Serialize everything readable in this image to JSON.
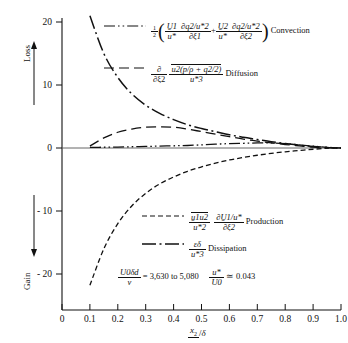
{
  "figure": {
    "y_axis": {
      "upper_label": "Loss",
      "lower_label": "Gain",
      "ticks": [
        "20",
        "10",
        "0",
        "- 10",
        "- 20"
      ],
      "tick_values": [
        20,
        10,
        0,
        -10,
        -20
      ]
    },
    "x_axis": {
      "label_num": "x",
      "label_sub": "2",
      "label_den": "δ",
      "ticks": [
        "0",
        "0.1",
        "0.2",
        "0.3",
        "0.4",
        "0.5",
        "0.6",
        "0.7",
        "0.8",
        "0.9",
        "1.0"
      ],
      "tick_values": [
        0,
        0.1,
        0.2,
        0.3,
        0.4,
        0.5,
        0.6,
        0.7,
        0.8,
        0.9,
        1.0
      ]
    },
    "legend": {
      "convection": {
        "name": "Convection",
        "style": "dash-dot-dot",
        "half": "1",
        "half_den": "2",
        "u1_num": "U̱1",
        "u1_den": "u*",
        "dq1_num": "∂q̱2/u*2",
        "dq1_den": "∂ξ1",
        "plus": "+",
        "u2_num": "U̱2",
        "u2_den": "u*",
        "dq2_num": "∂q̱2/u*2",
        "dq2_den": "∂ξ2"
      },
      "diffusion": {
        "name": "Diffusion",
        "style": "dashed",
        "op_num": "∂",
        "op_den": "∂ξ2",
        "num": "u2(p/ρ + q2/2)",
        "den": "u*3"
      },
      "production": {
        "name": "Production",
        "style": "dashed-short",
        "uu_num": "u̱1u2",
        "uu_den": "u*2",
        "du_num": "∂U̱1/u*",
        "du_den": "∂ξ2"
      },
      "dissipation": {
        "name": "Dissipation",
        "style": "dash-dot",
        "num": "εδ",
        "den": "u*3"
      }
    },
    "annotation": {
      "re_num": "U0δd",
      "re_den": "ν",
      "re_eq": "= 3,630 to 5,080",
      "ratio_num": "u*",
      "ratio_den": "U0",
      "ratio_eq": "≃ 0.043"
    }
  },
  "chart_data": {
    "type": "line",
    "title": "",
    "xlabel": "x2/δ",
    "ylabel": "Loss / Gain",
    "xlim": [
      0.0,
      1.0
    ],
    "ylim": [
      -23,
      22
    ],
    "grid": false,
    "legend_position": "inside-right",
    "zero_line": true,
    "series": [
      {
        "name": "Convection",
        "dash": "dash-dot-dot",
        "x": [
          0.1,
          0.15,
          0.2,
          0.25,
          0.3,
          0.35,
          0.4,
          0.45,
          0.5,
          0.55,
          0.6,
          0.65,
          0.7,
          0.75,
          0.8,
          0.85,
          0.9,
          0.95,
          1.0
        ],
        "y": [
          0.1,
          0.12,
          0.15,
          0.2,
          0.25,
          0.3,
          0.35,
          0.4,
          0.5,
          0.6,
          0.7,
          0.75,
          0.8,
          0.8,
          0.7,
          0.5,
          0.3,
          0.1,
          0.0
        ]
      },
      {
        "name": "Diffusion",
        "dash": "dashed",
        "x": [
          0.1,
          0.15,
          0.2,
          0.25,
          0.3,
          0.35,
          0.4,
          0.45,
          0.5,
          0.55,
          0.6,
          0.65,
          0.7,
          0.75,
          0.8,
          0.85,
          0.9,
          0.95,
          1.0
        ],
        "y": [
          0.3,
          1.6,
          2.5,
          3.0,
          3.3,
          3.35,
          3.3,
          3.0,
          2.6,
          2.2,
          1.8,
          1.4,
          1.1,
          0.8,
          0.55,
          0.35,
          0.15,
          0.05,
          0.0
        ]
      },
      {
        "name": "Production",
        "dash": "dashed-short",
        "x": [
          0.1,
          0.15,
          0.2,
          0.25,
          0.3,
          0.35,
          0.4,
          0.45,
          0.5,
          0.55,
          0.6,
          0.65,
          0.7,
          0.75,
          0.8,
          0.85,
          0.9,
          0.95,
          1.0
        ],
        "y": [
          -21.8,
          -16.0,
          -12.0,
          -9.2,
          -7.2,
          -5.7,
          -4.6,
          -3.7,
          -3.0,
          -2.4,
          -1.9,
          -1.5,
          -1.15,
          -0.85,
          -0.6,
          -0.4,
          -0.2,
          -0.05,
          0.0
        ]
      },
      {
        "name": "Dissipation",
        "dash": "dash-dot",
        "x": [
          0.1,
          0.15,
          0.2,
          0.25,
          0.3,
          0.35,
          0.4,
          0.45,
          0.5,
          0.55,
          0.6,
          0.65,
          0.7,
          0.75,
          0.8,
          0.85,
          0.9,
          0.95,
          1.0
        ],
        "y": [
          21.0,
          15.0,
          11.2,
          8.6,
          6.8,
          5.5,
          4.5,
          3.7,
          3.1,
          2.6,
          2.1,
          1.7,
          1.35,
          1.0,
          0.7,
          0.45,
          0.25,
          0.1,
          0.0
        ]
      }
    ]
  }
}
